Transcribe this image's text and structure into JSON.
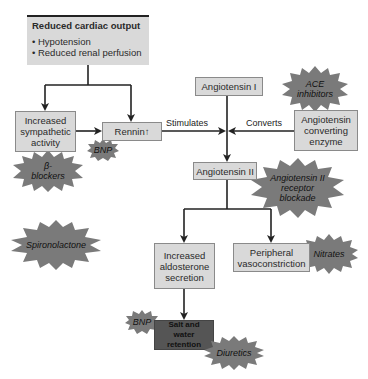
{
  "top_box": {
    "title": "Reduced cardiac output",
    "bullets": [
      "• Hypotension",
      "• Reduced renal perfusion"
    ]
  },
  "boxes": {
    "sympathetic": "Increased sympathetic activity",
    "rennin": "Rennin",
    "rennin_arrow": "↑",
    "angiotensin_i": "Angiotensin I",
    "ace": "Angiotensin converting enzyme",
    "angiotensin_ii": "Angiotensin II",
    "aldosterone": "Increased aldosterone secretion",
    "vasoconstriction": "Peripheral vasoconstriction",
    "salt_water": "Salt and water retention"
  },
  "labels": {
    "stimulates": "Stimulates",
    "converts": "Converts"
  },
  "drugs": {
    "beta_blockers": "β-blockers",
    "bnp_top": "BNP",
    "ace_inhibitors": "ACE inhibitors",
    "arb": "Angiotensin II receptor blockade",
    "spironolactone": "Spironolactone",
    "nitrates": "Nitrates",
    "bnp_bottom": "BNP",
    "diuretics": "Diuretics"
  },
  "colors": {
    "box": "#d9d9d9",
    "star": "#7a7a7a",
    "salt_box": "#555555"
  }
}
